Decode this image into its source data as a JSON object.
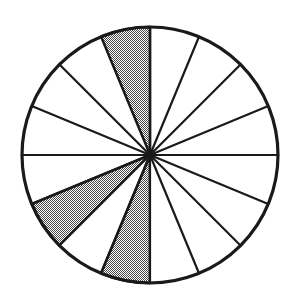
{
  "figure": {
    "caption": "",
    "background_color": "#ffffff"
  },
  "chart_data": {
    "type": "pie",
    "title": "",
    "subtitle": "",
    "xlabel": "",
    "ylabel": "",
    "total_sectors": 16,
    "sector_angle_degrees": 22.5,
    "shaded_count": 3,
    "unshaded_count": 13,
    "fraction_shaded": "3/16",
    "categories": [
      "shaded",
      "unshaded"
    ],
    "values": [
      3,
      13
    ],
    "legend_position": "none",
    "grid": false,
    "geometry": {
      "center_x": 150,
      "center_y": 155,
      "radius": 128,
      "start_angle_degrees": 0,
      "direction": "counterclockwise"
    },
    "colors": {
      "shaded_fill": "#9a9a9a",
      "unshaded_fill": "#ffffff",
      "stroke": "#1a1a1a",
      "background": "#ffffff"
    },
    "stroke_widths": {
      "outer_circle": 3.2,
      "spoke": 2.2,
      "sector_outline": 2.6
    },
    "sectors": [
      {
        "index": 0,
        "start_deg": 0.0,
        "end_deg": 22.5,
        "shaded": false
      },
      {
        "index": 1,
        "start_deg": 22.5,
        "end_deg": 45.0,
        "shaded": false
      },
      {
        "index": 2,
        "start_deg": 45.0,
        "end_deg": 67.5,
        "shaded": false
      },
      {
        "index": 3,
        "start_deg": 67.5,
        "end_deg": 90.0,
        "shaded": false
      },
      {
        "index": 4,
        "start_deg": 90.0,
        "end_deg": 112.5,
        "shaded": true
      },
      {
        "index": 5,
        "start_deg": 112.5,
        "end_deg": 135.0,
        "shaded": false
      },
      {
        "index": 6,
        "start_deg": 135.0,
        "end_deg": 157.5,
        "shaded": false
      },
      {
        "index": 7,
        "start_deg": 157.5,
        "end_deg": 180.0,
        "shaded": false
      },
      {
        "index": 8,
        "start_deg": 180.0,
        "end_deg": 202.5,
        "shaded": false
      },
      {
        "index": 9,
        "start_deg": 202.5,
        "end_deg": 225.0,
        "shaded": true
      },
      {
        "index": 10,
        "start_deg": 225.0,
        "end_deg": 247.5,
        "shaded": false
      },
      {
        "index": 11,
        "start_deg": 247.5,
        "end_deg": 270.0,
        "shaded": true
      },
      {
        "index": 12,
        "start_deg": 270.0,
        "end_deg": 292.5,
        "shaded": false
      },
      {
        "index": 13,
        "start_deg": 292.5,
        "end_deg": 315.0,
        "shaded": false
      },
      {
        "index": 14,
        "start_deg": 315.0,
        "end_deg": 337.5,
        "shaded": false
      },
      {
        "index": 15,
        "start_deg": 337.5,
        "end_deg": 360.0,
        "shaded": false
      }
    ]
  }
}
